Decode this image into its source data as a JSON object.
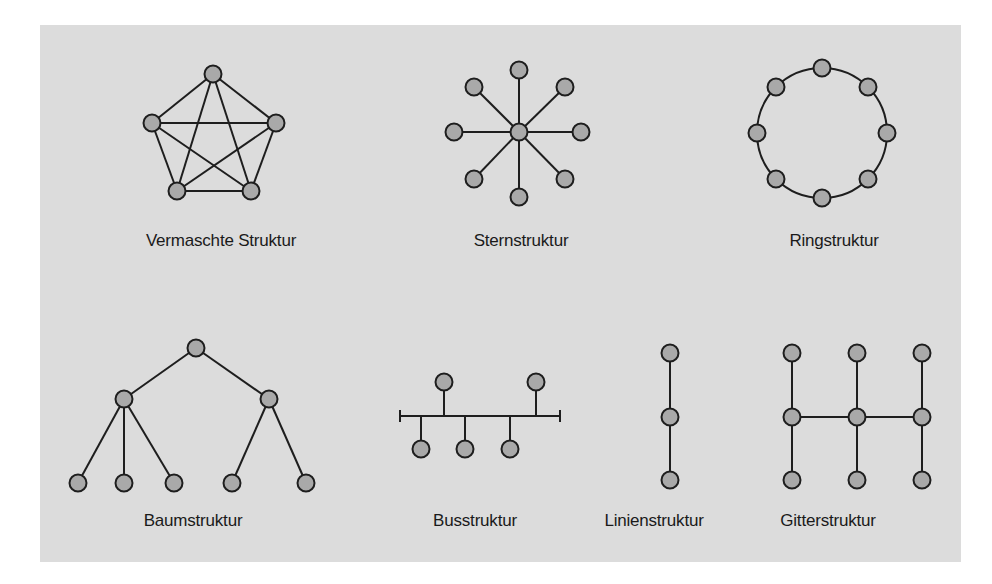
{
  "colors": {
    "page_background": "#ffffff",
    "panel_background": "#dcdcdc",
    "node_fill": "#a9a9a9",
    "line": "#1e1e1e",
    "label_text": "#1a1a1a"
  },
  "diagrams": [
    {
      "id": "mesh",
      "label": "Vermaschte Struktur",
      "label_pos": {
        "x": 221,
        "y": 231
      },
      "nodes": [
        [
          213,
          74
        ],
        [
          152,
          123
        ],
        [
          276,
          123
        ],
        [
          177,
          191
        ],
        [
          251,
          191
        ]
      ],
      "edges": [
        [
          0,
          1
        ],
        [
          0,
          2
        ],
        [
          0,
          3
        ],
        [
          0,
          4
        ],
        [
          1,
          2
        ],
        [
          1,
          3
        ],
        [
          1,
          4
        ],
        [
          2,
          3
        ],
        [
          2,
          4
        ],
        [
          3,
          4
        ]
      ]
    },
    {
      "id": "star",
      "label": "Sternstruktur",
      "label_pos": {
        "x": 521,
        "y": 231
      },
      "nodes": [
        [
          519,
          132
        ],
        [
          519,
          70
        ],
        [
          565,
          87
        ],
        [
          581,
          132
        ],
        [
          565,
          179
        ],
        [
          519,
          197
        ],
        [
          474,
          179
        ],
        [
          454,
          132
        ],
        [
          474,
          87
        ]
      ],
      "edges": [
        [
          0,
          1
        ],
        [
          0,
          2
        ],
        [
          0,
          3
        ],
        [
          0,
          4
        ],
        [
          0,
          5
        ],
        [
          0,
          6
        ],
        [
          0,
          7
        ],
        [
          0,
          8
        ]
      ]
    },
    {
      "id": "ring",
      "label": "Ringstruktur",
      "label_pos": {
        "x": 834,
        "y": 231
      },
      "ring": {
        "cx": 822,
        "cy": 133,
        "r": 65
      },
      "nodes": [
        [
          822,
          68
        ],
        [
          868,
          87
        ],
        [
          887,
          133
        ],
        [
          868,
          179
        ],
        [
          822,
          198
        ],
        [
          776,
          179
        ],
        [
          757,
          133
        ],
        [
          776,
          87
        ]
      ],
      "edges": []
    },
    {
      "id": "tree",
      "label": "Baumstruktur",
      "label_pos": {
        "x": 193,
        "y": 511
      },
      "nodes": [
        [
          196,
          348
        ],
        [
          124,
          399
        ],
        [
          269,
          399
        ],
        [
          78,
          483
        ],
        [
          124,
          483
        ],
        [
          174,
          483
        ],
        [
          232,
          483
        ],
        [
          306,
          483
        ]
      ],
      "edges": [
        [
          0,
          1
        ],
        [
          0,
          2
        ],
        [
          1,
          3
        ],
        [
          1,
          4
        ],
        [
          1,
          5
        ],
        [
          2,
          6
        ],
        [
          2,
          7
        ]
      ]
    },
    {
      "id": "bus",
      "label": "Busstruktur",
      "label_pos": {
        "x": 475,
        "y": 511
      },
      "bus_line": {
        "x1": 400,
        "x2": 560,
        "y": 416,
        "tick": 6
      },
      "nodes": [
        [
          444,
          382
        ],
        [
          536,
          382
        ],
        [
          421,
          449
        ],
        [
          465,
          449
        ],
        [
          510,
          449
        ]
      ],
      "taps": [
        [
          444,
          382
        ],
        [
          536,
          382
        ],
        [
          421,
          449
        ],
        [
          465,
          449
        ],
        [
          510,
          449
        ]
      ],
      "edges": []
    },
    {
      "id": "line",
      "label": "Linienstruktur",
      "label_pos": {
        "x": 654,
        "y": 511
      },
      "nodes": [
        [
          670,
          353
        ],
        [
          670,
          417
        ],
        [
          670,
          480
        ]
      ],
      "edges": [
        [
          0,
          1
        ],
        [
          1,
          2
        ]
      ]
    },
    {
      "id": "grid",
      "label": "Gitterstruktur",
      "label_pos": {
        "x": 828,
        "y": 511
      },
      "nodes": [
        [
          792,
          353
        ],
        [
          857,
          353
        ],
        [
          922,
          353
        ],
        [
          792,
          417
        ],
        [
          857,
          417
        ],
        [
          922,
          417
        ],
        [
          792,
          480
        ],
        [
          857,
          480
        ],
        [
          922,
          480
        ]
      ],
      "edges": [
        [
          0,
          3
        ],
        [
          3,
          6
        ],
        [
          1,
          4
        ],
        [
          4,
          7
        ],
        [
          2,
          5
        ],
        [
          5,
          8
        ],
        [
          3,
          4
        ],
        [
          4,
          5
        ]
      ]
    }
  ],
  "node_radius": 8.5
}
